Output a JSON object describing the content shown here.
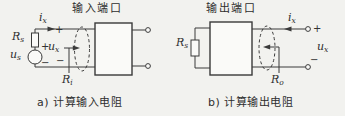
{
  "figure": {
    "colors": {
      "background": "#f2f2ef",
      "line": "#3a3a3a",
      "box_fill": "#fafaf8"
    },
    "panel_a": {
      "port_label": "输入端口",
      "caption": "a) 计算输入电阻",
      "labels": {
        "ix": {
          "base": "i",
          "sub": "x"
        },
        "Rs": {
          "base": "R",
          "sub": "s"
        },
        "us": {
          "base": "u",
          "sub": "s"
        },
        "ux": {
          "base": "u",
          "sub": "x"
        },
        "Ri": {
          "base": "R",
          "sub": "i"
        },
        "src_plus": "+",
        "src_minus": "−",
        "port_plus": "+",
        "port_minus": "−"
      }
    },
    "panel_b": {
      "port_label": "输出端口",
      "caption": "b) 计算输出电阻",
      "labels": {
        "ix": {
          "base": "i",
          "sub": "x"
        },
        "Rs": {
          "base": "R",
          "sub": "s"
        },
        "ux": {
          "base": "u",
          "sub": "x"
        },
        "Ro": {
          "base": "R",
          "sub": "o"
        },
        "term_plus": "+",
        "term_minus": "−"
      }
    }
  }
}
